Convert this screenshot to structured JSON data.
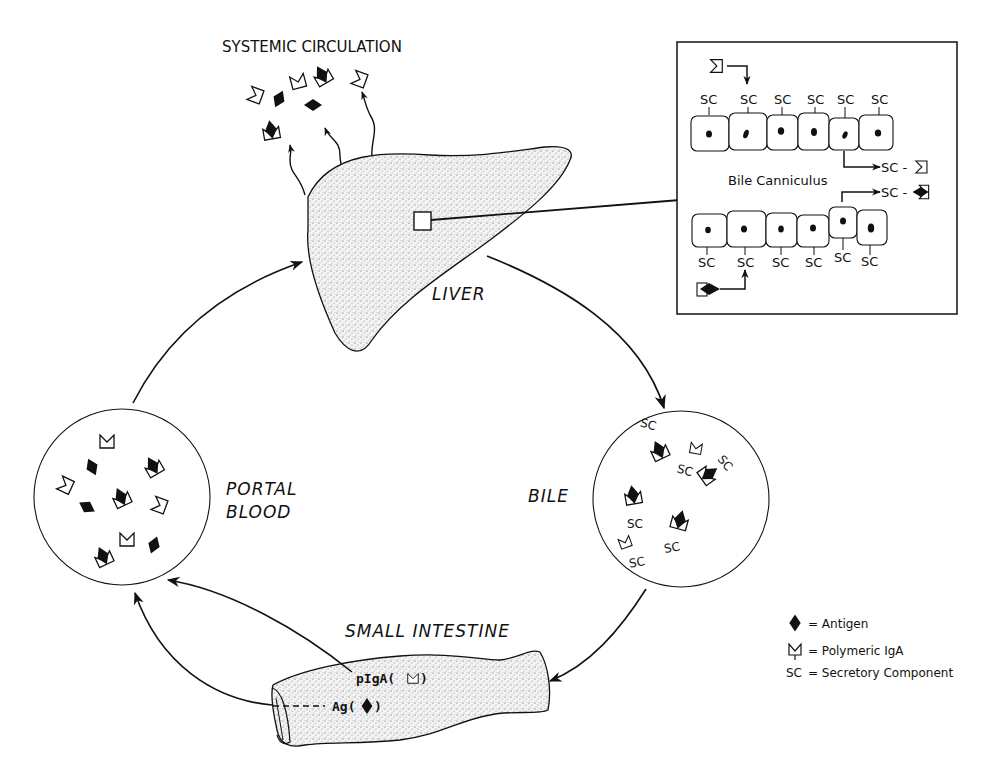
{
  "diagram": {
    "labels": {
      "systemic_circulation": "SYSTEMIC CIRCULATION",
      "liver": "LIVER",
      "bile": "BILE",
      "portal_blood_line1": "PORTAL",
      "portal_blood_line2": "BLOOD",
      "small_intestine": "SMALL INTESTINE",
      "pigA": "pIgA(",
      "pigA_close": ")",
      "ag": "Ag(",
      "ag_close": ")"
    },
    "inset": {
      "title": "Bile Canniculus",
      "sc": "SC",
      "top_row_sc_count": 6,
      "bottom_row_sc_count": 6,
      "out_top": "SC -",
      "out_bottom": "SC -"
    },
    "bile_circle": {
      "sc": "SC"
    },
    "legend": {
      "items": [
        {
          "symbol": "antigen",
          "text": "= Antigen"
        },
        {
          "symbol": "polymeric-iga",
          "text": "= Polymeric IgA"
        },
        {
          "symbol": "SC",
          "text": "= Secretory Component"
        }
      ]
    },
    "flow": [
      "Small Intestine",
      "Portal Blood",
      "Liver",
      "Bile",
      "Small Intestine"
    ]
  }
}
